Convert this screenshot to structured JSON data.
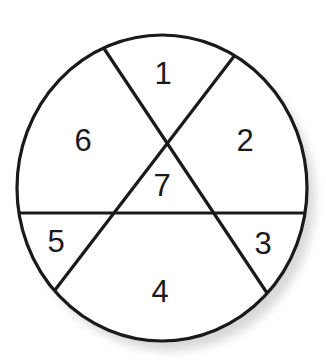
{
  "diagram": {
    "type": "circle-divided-by-three-lines",
    "colors": {
      "stroke": "#1a1a1a",
      "fill": "#ffffff",
      "shadow": "#d6d6d6"
    },
    "circle": {
      "cx": 162,
      "cy": 188,
      "rx": 145,
      "ry": 153
    },
    "lines": [
      {
        "id": "diagonal-left-to-right",
        "x1": 103,
        "y1": 47,
        "x2": 267,
        "y2": 293
      },
      {
        "id": "diagonal-right-to-left",
        "x1": 235,
        "y1": 55,
        "x2": 55,
        "y2": 290
      },
      {
        "id": "horizontal",
        "x1": 18,
        "y1": 213,
        "x2": 306,
        "y2": 213
      }
    ],
    "regions": [
      {
        "label": "1",
        "x": 163,
        "y": 73
      },
      {
        "label": "2",
        "x": 245,
        "y": 140
      },
      {
        "label": "3",
        "x": 263,
        "y": 243
      },
      {
        "label": "4",
        "x": 160,
        "y": 291
      },
      {
        "label": "5",
        "x": 56,
        "y": 241
      },
      {
        "label": "6",
        "x": 83,
        "y": 140
      },
      {
        "label": "7",
        "x": 162,
        "y": 185
      }
    ]
  }
}
